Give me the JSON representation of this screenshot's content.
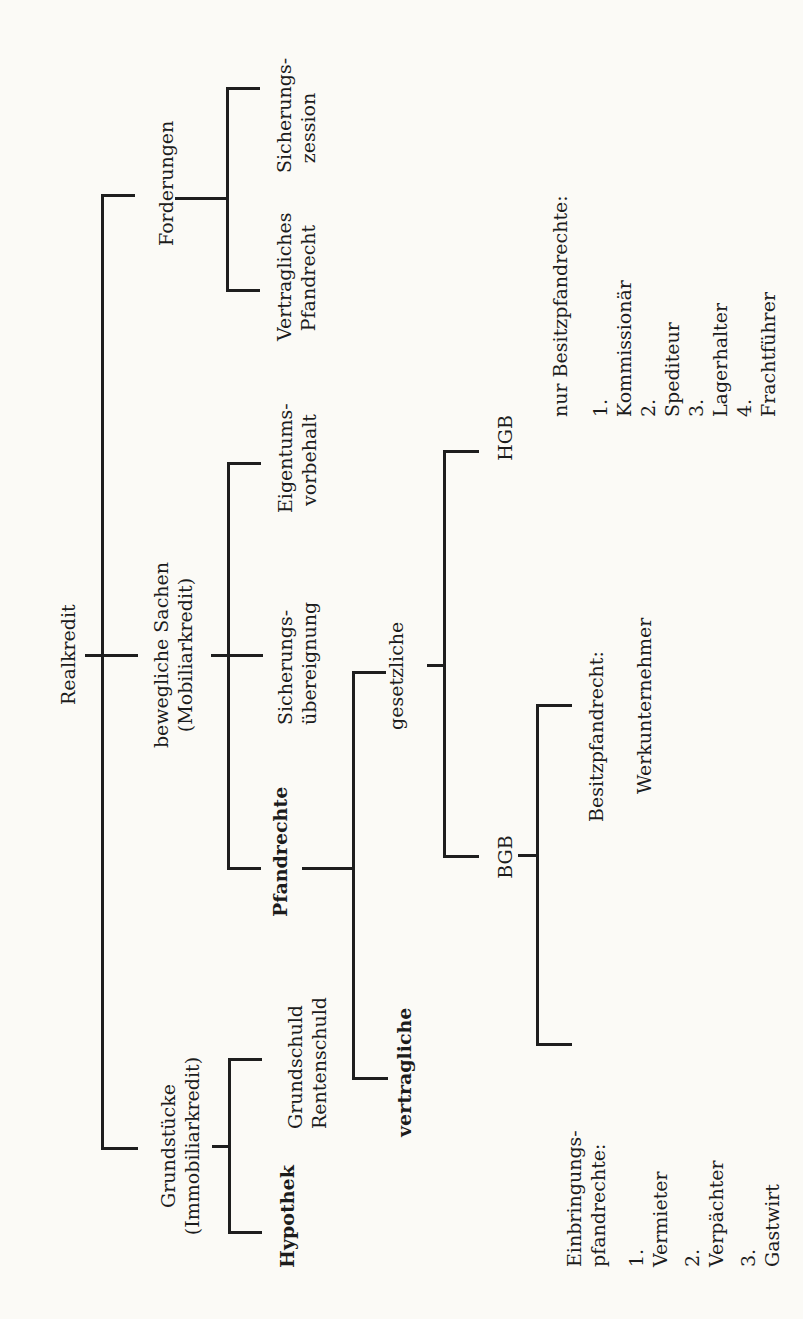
{
  "diagram": {
    "root": "Realkredit",
    "branches": {
      "forderungen": {
        "label": "Forderungen",
        "children": [
          {
            "line1": "Sicherungs-",
            "line2": "zession"
          },
          {
            "line1": "Vertragliches",
            "line2": "Pfandrecht"
          }
        ]
      },
      "bewegliche": {
        "line1": "bewegliche Sachen",
        "line2": "(Mobiliarkredit)",
        "children": {
          "eigentumsvorbehalt": {
            "line1": "Eigentums-",
            "line2": "vorbehalt"
          },
          "sicherungsuebereignung": {
            "line1": "Sicherungs-",
            "line2": "übereignung"
          },
          "pfandrechte": {
            "label": "Pfandrechte",
            "gesetzliche": {
              "label": "gesetzliche",
              "hgb": {
                "label": "HGB",
                "heading": "nur Besitzpfandrechte:",
                "items": [
                  {
                    "num": "1.",
                    "text": "Kommissionär"
                  },
                  {
                    "num": "2.",
                    "text": "Spediteur"
                  },
                  {
                    "num": "3.",
                    "text": "Lagerhalter"
                  },
                  {
                    "num": "4.",
                    "text": "Frachtführer"
                  }
                ]
              },
              "bgb": {
                "label": "BGB",
                "besitz": {
                  "line1": "Besitzpfandrecht:",
                  "line2": "Werkunternehmer"
                },
                "einbringung": {
                  "line1": "Einbringungs-",
                  "line2": "pfandrechte:",
                  "items": [
                    {
                      "num": "1.",
                      "text": "Vermieter"
                    },
                    {
                      "num": "2.",
                      "text": "Verpächter"
                    },
                    {
                      "num": "3.",
                      "text": "Gastwirt"
                    }
                  ]
                }
              }
            },
            "vertragliche": {
              "label": "vertragliche"
            }
          }
        }
      },
      "grundstuecke": {
        "line1": "Grundstücke",
        "line2": "(Immobiliarkredit)",
        "children": {
          "grundschuld": {
            "line1": "Grundschuld",
            "line2": "Rentenschuld"
          },
          "hypothek": {
            "label": "Hypothek"
          }
        }
      }
    }
  }
}
